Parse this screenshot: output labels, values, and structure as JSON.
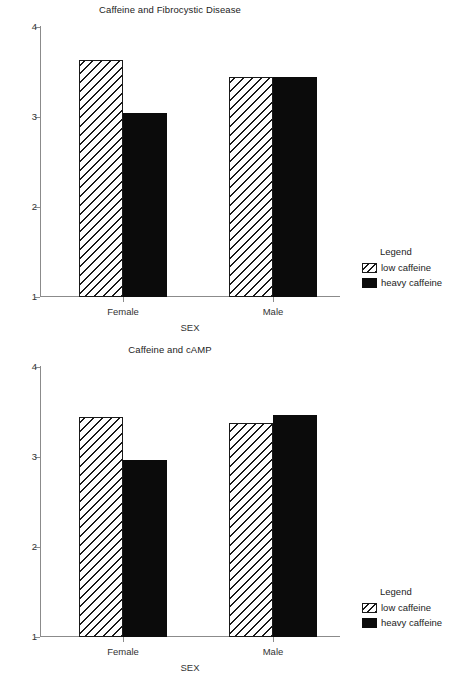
{
  "chart_data": [
    {
      "type": "bar",
      "title": "Caffeine and Fibrocystic Disease",
      "xlabel": "SEX",
      "ylabel": "",
      "categories": [
        "Female",
        "Male"
      ],
      "ylim": [
        1,
        4
      ],
      "yticks": [
        1,
        2,
        3,
        4
      ],
      "ytick_labels": [
        "1",
        "2",
        "3",
        "4"
      ],
      "grid": false,
      "legend": {
        "title": "Legend",
        "position": "right",
        "entries": [
          "low caffeine",
          "heavy caffeine"
        ]
      },
      "series": [
        {
          "name": "low caffeine",
          "fill": "hatch",
          "values": [
            3.63,
            3.44
          ]
        },
        {
          "name": "heavy caffeine",
          "fill": "solid",
          "values": [
            3.04,
            3.44
          ]
        }
      ]
    },
    {
      "type": "bar",
      "title": "Caffeine and cAMP",
      "xlabel": "SEX",
      "ylabel": "",
      "categories": [
        "Female",
        "Male"
      ],
      "ylim": [
        1,
        4
      ],
      "yticks": [
        1,
        2,
        3,
        4
      ],
      "ytick_labels": [
        "1",
        "2",
        "3",
        "4"
      ],
      "grid": false,
      "legend": {
        "title": "Legend",
        "position": "right",
        "entries": [
          "low caffeine",
          "heavy caffeine"
        ]
      },
      "series": [
        {
          "name": "low caffeine",
          "fill": "hatch",
          "values": [
            3.45,
            3.38
          ]
        },
        {
          "name": "heavy caffeine",
          "fill": "solid",
          "values": [
            2.97,
            3.47
          ]
        }
      ]
    }
  ],
  "colors": {
    "axis": "#8b8b8b",
    "bar_solid": "#0b0b0b",
    "bar_hatch_line": "#1a1a1a",
    "text": "#232323",
    "background": "#ffffff"
  }
}
